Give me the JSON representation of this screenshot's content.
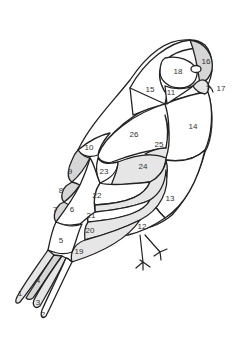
{
  "diagram": {
    "colors": {
      "outline": "#222222",
      "white_piece": "#ffffff",
      "grey_piece": "#d6d6d6",
      "light_grey_piece": "#e6e6e6"
    },
    "labels": [
      {
        "n": "1",
        "x": 20,
        "y": 294
      },
      {
        "n": "2",
        "x": 43,
        "y": 315
      },
      {
        "n": "3",
        "x": 38,
        "y": 303
      },
      {
        "n": "4",
        "x": 38,
        "y": 281
      },
      {
        "n": "5",
        "x": 61,
        "y": 241
      },
      {
        "n": "6",
        "x": 72,
        "y": 210
      },
      {
        "n": "7",
        "x": 55,
        "y": 210
      },
      {
        "n": "8",
        "x": 61,
        "y": 191
      },
      {
        "n": "9",
        "x": 70,
        "y": 172
      },
      {
        "n": "10",
        "x": 89,
        "y": 148
      },
      {
        "n": "11",
        "x": 171,
        "y": 93
      },
      {
        "n": "12",
        "x": 142,
        "y": 227
      },
      {
        "n": "13",
        "x": 170,
        "y": 199
      },
      {
        "n": "14",
        "x": 193,
        "y": 127
      },
      {
        "n": "15",
        "x": 150,
        "y": 90
      },
      {
        "n": "16",
        "x": 206,
        "y": 62
      },
      {
        "n": "17",
        "x": 221,
        "y": 89
      },
      {
        "n": "18",
        "x": 178,
        "y": 72
      },
      {
        "n": "19",
        "x": 79,
        "y": 252
      },
      {
        "n": "20",
        "x": 90,
        "y": 231
      },
      {
        "n": "21",
        "x": 91,
        "y": 216
      },
      {
        "n": "22",
        "x": 97,
        "y": 196
      },
      {
        "n": "23",
        "x": 104,
        "y": 172
      },
      {
        "n": "24",
        "x": 143,
        "y": 167
      },
      {
        "n": "25",
        "x": 159,
        "y": 145
      },
      {
        "n": "26",
        "x": 134,
        "y": 135
      }
    ]
  }
}
